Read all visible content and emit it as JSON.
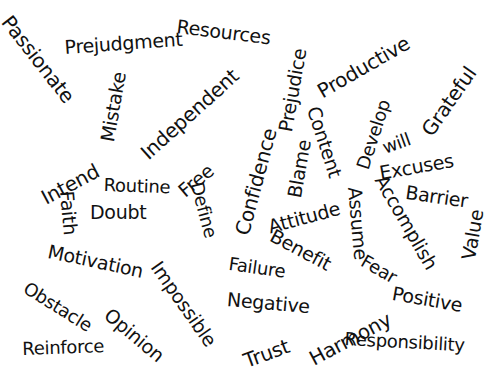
{
  "words": [
    {
      "text": "Passionate",
      "x": 14,
      "y": 12,
      "size": 20,
      "rot": 52
    },
    {
      "text": "Prejudgment",
      "x": 64,
      "y": 38,
      "size": 19,
      "rot": -4
    },
    {
      "text": "Resources",
      "x": 178,
      "y": 17,
      "size": 19,
      "rot": 7
    },
    {
      "text": "Mistake",
      "x": 98,
      "y": 140,
      "size": 19,
      "rot": -80
    },
    {
      "text": "Independent",
      "x": 137,
      "y": 148,
      "size": 20,
      "rot": -42
    },
    {
      "text": "Prejudice",
      "x": 276,
      "y": 130,
      "size": 19,
      "rot": -80
    },
    {
      "text": "Productive",
      "x": 314,
      "y": 84,
      "size": 20,
      "rot": -30
    },
    {
      "text": "Grateful",
      "x": 418,
      "y": 128,
      "size": 20,
      "rot": -55
    },
    {
      "text": "Intend",
      "x": 38,
      "y": 190,
      "size": 20,
      "rot": -28
    },
    {
      "text": "Content",
      "x": 322,
      "y": 104,
      "size": 19,
      "rot": 72
    },
    {
      "text": "Develop",
      "x": 354,
      "y": 166,
      "size": 18,
      "rot": -72
    },
    {
      "text": "will",
      "x": 380,
      "y": 140,
      "size": 18,
      "rot": -20
    },
    {
      "text": "Excuses",
      "x": 378,
      "y": 164,
      "size": 19,
      "rot": -10
    },
    {
      "text": "Confidence",
      "x": 232,
      "y": 232,
      "size": 20,
      "rot": -75
    },
    {
      "text": "Blame",
      "x": 285,
      "y": 196,
      "size": 19,
      "rot": -80
    },
    {
      "text": "Routine",
      "x": 104,
      "y": 176,
      "size": 18,
      "rot": 2
    },
    {
      "text": "Free",
      "x": 175,
      "y": 186,
      "size": 19,
      "rot": -40
    },
    {
      "text": "Faith",
      "x": 76,
      "y": 190,
      "size": 19,
      "rot": 85
    },
    {
      "text": "Doubt",
      "x": 90,
      "y": 203,
      "size": 19,
      "rot": 0
    },
    {
      "text": "Define",
      "x": 205,
      "y": 180,
      "size": 18,
      "rot": 75
    },
    {
      "text": "Attitude",
      "x": 266,
      "y": 218,
      "size": 19,
      "rot": -15
    },
    {
      "text": "Assume",
      "x": 364,
      "y": 186,
      "size": 19,
      "rot": 85
    },
    {
      "text": "Accomplish",
      "x": 388,
      "y": 172,
      "size": 19,
      "rot": 60
    },
    {
      "text": "Barrier",
      "x": 407,
      "y": 183,
      "size": 19,
      "rot": 8
    },
    {
      "text": "Value",
      "x": 459,
      "y": 258,
      "size": 19,
      "rot": -80
    },
    {
      "text": "Benefit",
      "x": 276,
      "y": 226,
      "size": 19,
      "rot": 28
    },
    {
      "text": "Fear",
      "x": 367,
      "y": 252,
      "size": 18,
      "rot": 30
    },
    {
      "text": "Motivation",
      "x": 50,
      "y": 242,
      "size": 19,
      "rot": 12
    },
    {
      "text": "Impossible",
      "x": 163,
      "y": 258,
      "size": 19,
      "rot": 55
    },
    {
      "text": "Failure",
      "x": 230,
      "y": 255,
      "size": 18,
      "rot": 8
    },
    {
      "text": "Negative",
      "x": 228,
      "y": 290,
      "size": 19,
      "rot": 5
    },
    {
      "text": "Obstacle",
      "x": 30,
      "y": 279,
      "size": 18,
      "rot": 32
    },
    {
      "text": "Opinion",
      "x": 113,
      "y": 305,
      "size": 19,
      "rot": 40
    },
    {
      "text": "Harmony",
      "x": 306,
      "y": 351,
      "size": 20,
      "rot": -28
    },
    {
      "text": "Positive",
      "x": 394,
      "y": 284,
      "size": 19,
      "rot": 10
    },
    {
      "text": "Trust",
      "x": 241,
      "y": 352,
      "size": 20,
      "rot": -20
    },
    {
      "text": "Reinforce",
      "x": 22,
      "y": 340,
      "size": 18,
      "rot": -2
    },
    {
      "text": "Responsibility",
      "x": 345,
      "y": 330,
      "size": 18,
      "rot": 3
    }
  ]
}
